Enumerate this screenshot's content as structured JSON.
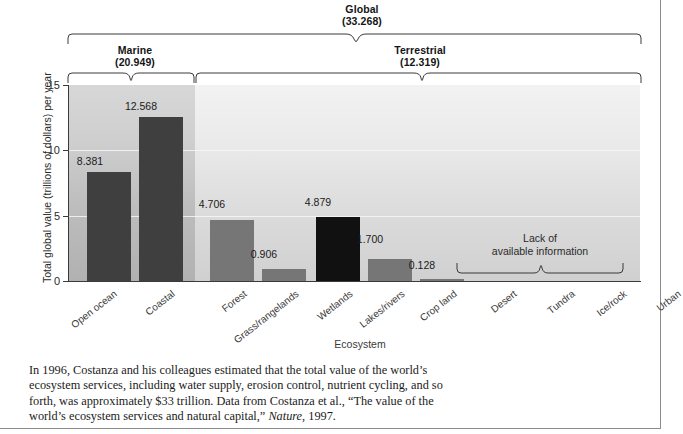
{
  "chart_data": {
    "type": "bar",
    "title": "",
    "xlabel": "Ecosystem",
    "ylabel": "Total global value (trillions of dollars) per year",
    "ylim": [
      0,
      15
    ],
    "yticks": [
      "0",
      "5",
      "10",
      "15"
    ],
    "grid": true,
    "legend": "none",
    "categories": [
      "Open ocean",
      "Coastal",
      "Forest",
      "Grass/rangelands",
      "Wetlands",
      "Lakes/rivers",
      "Crop land",
      "Desert",
      "Tundra",
      "Ice/rock",
      "Urban"
    ],
    "values": [
      8.381,
      12.568,
      4.706,
      0.906,
      4.879,
      1.7,
      0.128,
      null,
      null,
      null,
      null
    ],
    "value_labels": [
      "8.381",
      "12.568",
      "4.706",
      "0.906",
      "4.879",
      "1.700",
      "0.128",
      "",
      "",
      "",
      ""
    ],
    "bar_colors": [
      "#3f3f3f",
      "#3f3f3f",
      "#767676",
      "#767676",
      "#111111",
      "#767676",
      "#767676",
      null,
      null,
      null,
      null
    ],
    "no_data_note": "Lack of\navailable information",
    "no_data_categories": [
      "Desert",
      "Tundra",
      "Ice/rock",
      "Urban"
    ],
    "groups": [
      {
        "name": "Global",
        "value": "(33.268)",
        "members": "all"
      },
      {
        "name": "Marine",
        "value": "(20.949)",
        "members": [
          "Open ocean",
          "Coastal"
        ]
      },
      {
        "name": "Terrestrial",
        "value": "(12.319)",
        "members": [
          "Forest",
          "Grass/rangelands",
          "Wetlands",
          "Lakes/rivers",
          "Crop land",
          "Desert",
          "Tundra",
          "Ice/rock",
          "Urban"
        ]
      }
    ]
  },
  "groups": {
    "global": {
      "label": "Global",
      "value": "(33.268)"
    },
    "marine": {
      "label": "Marine",
      "value": "(20.949)"
    },
    "terrestrial": {
      "label": "Terrestrial",
      "value": "(12.319)"
    }
  },
  "axes": {
    "ylabel": "Total global value (trillions of dollars) per year",
    "xlabel": "Ecosystem",
    "ytick0": "0",
    "ytick5": "5",
    "ytick10": "10",
    "ytick15": "15"
  },
  "annotations": {
    "lack_line1": "Lack of",
    "lack_line2": "available information"
  },
  "caption": {
    "part1": "In 1996, Costanza and his colleagues estimated that the total value of the world’s ecosystem services, including water supply, erosion control, nutrient cycling, and so forth, was approximately $33 trillion. Data from Costanza et al., “The value of the world’s ecosystem services and natural capital,” ",
    "journal": "Nature",
    "part2": ", 1997."
  },
  "colors": {
    "bar_dark": "#3f3f3f",
    "bar_mid": "#767676",
    "bar_black": "#111111",
    "panel_marine": "#c6c6c6",
    "panel_terrestrial": "#e4e4e4",
    "axis": "#3b3b3b",
    "text": "#1b1b1b"
  }
}
